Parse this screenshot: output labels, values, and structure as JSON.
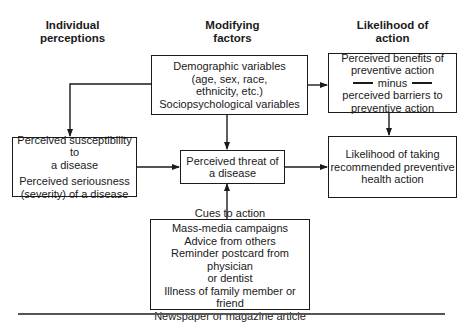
{
  "headers": {
    "individual": [
      "Individual",
      "perceptions"
    ],
    "modifying": [
      "Modifying",
      "factors"
    ],
    "likelihood": [
      "Likelihood of",
      "action"
    ]
  },
  "boxes": {
    "demographic": {
      "lines": [
        "Demographic variables",
        "(age, sex, race,",
        "ethnicity, etc.)",
        "Sociopsychological variables"
      ]
    },
    "susceptibility": {
      "group1": [
        "Perceived susceptibility to",
        "a disease"
      ],
      "group2": [
        "Perceived seriousness",
        "(severity) of a disease"
      ]
    },
    "threat": {
      "lines": [
        "Perceived threat of",
        "a disease"
      ]
    },
    "benefits": {
      "top": [
        "Perceived benefits of",
        "preventive action"
      ],
      "minus": "minus",
      "bottom": [
        "perceived barriers to",
        "preventive action"
      ]
    },
    "likelihood": {
      "lines": [
        "Likelihood of taking",
        "recommended preventive",
        "health action"
      ]
    },
    "cues": {
      "title": "Cues to action",
      "items": [
        "Mass-media campaigns",
        "Advice from others",
        "Reminder postcard from physician",
        "or dentist",
        "Illness of family member or friend",
        "Newspaper or magazine article"
      ]
    }
  },
  "colors": {
    "line": "#1a1a1a",
    "rule": "#555555"
  }
}
